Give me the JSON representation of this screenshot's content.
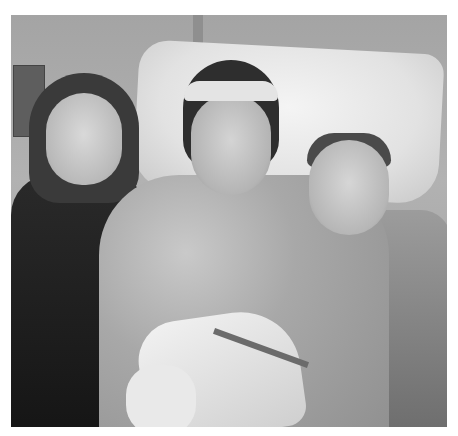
{
  "image": {
    "description": "Grayscale photo of a woman in a hospital gown lying in a hospital bed with a bandaged arm and external fixator, flanked by a smiling girl on the left and a smiling boy on the right",
    "colors": {
      "background": "#ffffff",
      "wall": "#a9a9a9",
      "pillow": "#e8e8e8",
      "dark_clothing": "#1e1e1e"
    }
  }
}
